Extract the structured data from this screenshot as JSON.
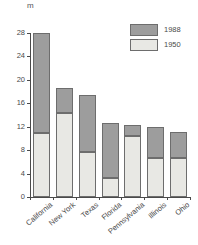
{
  "chart_data": {
    "type": "bar",
    "subtype": "overlaid-stacked",
    "title": "",
    "xlabel": "",
    "ylabel": "m",
    "unit_label": "m",
    "categories": [
      "California",
      "New York",
      "Texas",
      "Florida",
      "Pennsylvania",
      "Illinois",
      "Ohio"
    ],
    "series": [
      {
        "name": "1988",
        "values": [
          28.0,
          18.6,
          17.4,
          12.6,
          12.3,
          12.0,
          11.1
        ]
      },
      {
        "name": "1950",
        "values": [
          11.0,
          14.3,
          7.7,
          3.2,
          10.4,
          6.7,
          6.7
        ]
      }
    ],
    "ylim": [
      0,
      28
    ],
    "yticks": [
      0,
      4,
      8,
      12,
      16,
      20,
      24,
      28
    ],
    "ytick_labels": [
      "0",
      "4",
      "8",
      "12",
      "16",
      "20",
      "24",
      "28"
    ],
    "grid": false,
    "legend_position": "top-right",
    "colors": {
      "series_1988": "#9d9d9d",
      "series_1950": "#e8e8e4",
      "outline": "#6d6d6d",
      "axis": "#4a4a4a",
      "text": "#4a4a4a"
    }
  },
  "legend": {
    "items": [
      {
        "label": "1988",
        "color": "#9d9d9d"
      },
      {
        "label": "1950",
        "color": "#e8e8e4"
      }
    ]
  },
  "axes": {
    "unit": "m",
    "y_tick_labels": [
      "28",
      "24",
      "20",
      "16",
      "12",
      "8",
      "4",
      "0"
    ],
    "x_tick_labels": [
      "California",
      "New York",
      "Texas",
      "Florida",
      "Pennsylvania",
      "Illinois",
      "Ohio"
    ]
  }
}
